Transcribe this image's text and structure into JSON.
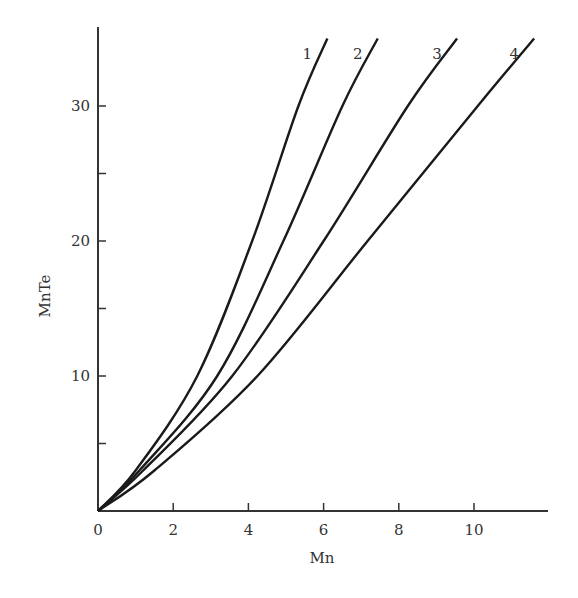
{
  "chart_data": {
    "type": "line",
    "title": "",
    "xlabel": "Mn",
    "ylabel": "MnTe",
    "xlim": [
      0,
      11.8
    ],
    "ylim": [
      0,
      35.5
    ],
    "xticks": [
      0,
      2,
      4,
      6,
      8,
      10
    ],
    "yticks_labeled": [
      10,
      20,
      30
    ],
    "yticks_minor": [
      5,
      15,
      25
    ],
    "grid": false,
    "legend": "inline curve labels at top",
    "series": [
      {
        "name": "1",
        "x": [
          0,
          1.0,
          2.64,
          4.1,
          5.33,
          6.1
        ],
        "y": [
          0,
          3,
          10,
          20,
          30,
          35
        ]
      },
      {
        "name": "2",
        "x": [
          0,
          1.1,
          3.17,
          4.93,
          6.5,
          7.44
        ],
        "y": [
          0,
          3,
          10,
          20,
          30,
          35
        ]
      },
      {
        "name": "3",
        "x": [
          0,
          1.2,
          3.57,
          6.0,
          8.24,
          9.55
        ],
        "y": [
          0,
          3,
          10,
          20,
          30,
          35
        ]
      },
      {
        "name": "4",
        "x": [
          0,
          1.5,
          4.24,
          7.17,
          10.1,
          11.6
        ],
        "y": [
          0,
          3,
          10,
          20,
          30,
          35
        ]
      }
    ]
  },
  "axes": {
    "x_label": "Mn",
    "y_label": "MnTe",
    "x_tick_labels": [
      "0",
      "2",
      "4",
      "6",
      "8",
      "10"
    ],
    "y_tick_labels": [
      "10",
      "20",
      "30"
    ]
  },
  "curve_labels": [
    "1",
    "2",
    "3",
    "4"
  ],
  "style": {
    "line_color": "#1a1a1a",
    "axis_color": "#333333",
    "background": "#ffffff"
  }
}
